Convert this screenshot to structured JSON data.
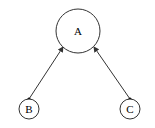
{
  "diagram": {
    "type": "directed-graph",
    "nodes": [
      {
        "id": "A",
        "label": "A",
        "cx": 78,
        "cy": 31,
        "r": 22
      },
      {
        "id": "B",
        "label": "B",
        "cx": 29,
        "cy": 109,
        "r": 10
      },
      {
        "id": "C",
        "label": "C",
        "cx": 130,
        "cy": 109,
        "r": 10
      }
    ],
    "edges": [
      {
        "from": "B",
        "to": "A",
        "tail": "dot",
        "head": "arrow"
      },
      {
        "from": "C",
        "to": "A",
        "tail": "dot",
        "head": "arrow"
      }
    ],
    "colors": {
      "stroke": "#333333",
      "fill": "#ffffff",
      "text": "#000000"
    }
  }
}
